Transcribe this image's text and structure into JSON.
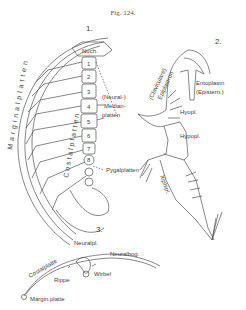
{
  "figure": {
    "title": "Fig. 124.",
    "panels": [
      {
        "number": "1.",
        "labels": {
          "nuchal": "Nuch.",
          "neural_numbers": [
            "1",
            "2",
            "3",
            "4",
            "5",
            "6",
            "7",
            "8"
          ],
          "neural_median": "(Neural-)",
          "median": "Median-",
          "platten": "platten",
          "costal": "Costalplatten",
          "marginal": "Marginalplatten",
          "pygal": "Pygalplatten"
        }
      },
      {
        "number": "2.",
        "labels": {
          "clavicular": "(Claviculare)",
          "epiplastron": "Epiplastron",
          "entoplastron": "Entoplastn",
          "episternum": "(Epistern.)",
          "hyoplastron": "Hyopl.",
          "hypoplastron": "Hypopl.",
          "xiphiplastron": "Xiphipl."
        }
      },
      {
        "number": "3.",
        "labels": {
          "neuralpl": "Neuralpl.",
          "neuralbog": "Neuralbog.",
          "costalplatte": "Costalplatte",
          "rippe": "Rippe",
          "wirbel": "Wirbel",
          "marginplatte": "Margin.platte"
        }
      }
    ]
  }
}
